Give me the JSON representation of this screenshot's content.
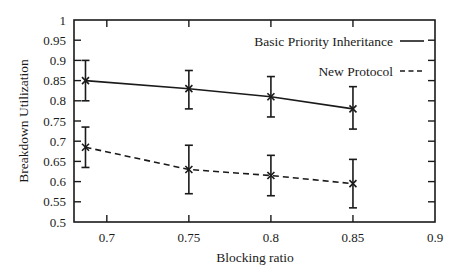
{
  "chart_data": {
    "type": "line",
    "title": "",
    "xlabel": "Blocking ratio",
    "ylabel": "Breakdown Utilization",
    "xlim": [
      0.68,
      0.9
    ],
    "ylim": [
      0.5,
      1.0
    ],
    "x_ticks": [
      0.7,
      0.75,
      0.8,
      0.85,
      0.9
    ],
    "x_tick_labels": [
      "0.7",
      "0.75",
      "0.8",
      "0.85",
      "0.9"
    ],
    "y_ticks": [
      0.5,
      0.55,
      0.6,
      0.65,
      0.7,
      0.75,
      0.8,
      0.85,
      0.9,
      0.95,
      1.0
    ],
    "y_tick_labels": [
      "0.5",
      "0.55",
      "0.6",
      "0.65",
      "0.7",
      "0.75",
      "0.8",
      "0.85",
      "0.9",
      "0.95",
      "1"
    ],
    "grid": false,
    "legend_position": "top-right",
    "x": [
      0.687,
      0.75,
      0.8,
      0.85
    ],
    "series": [
      {
        "name": "Basic Priority Inheritance",
        "line_style": "solid",
        "values": [
          0.85,
          0.83,
          0.81,
          0.78
        ],
        "error_low": [
          0.8,
          0.78,
          0.76,
          0.73
        ],
        "error_high": [
          0.9,
          0.875,
          0.86,
          0.835
        ]
      },
      {
        "name": "New Protocol",
        "line_style": "dashed",
        "values": [
          0.685,
          0.63,
          0.615,
          0.595
        ],
        "error_low": [
          0.635,
          0.57,
          0.565,
          0.535
        ],
        "error_high": [
          0.735,
          0.69,
          0.665,
          0.655
        ]
      }
    ]
  },
  "colors": {
    "ink": "#1a1a1a",
    "background": "#ffffff"
  }
}
